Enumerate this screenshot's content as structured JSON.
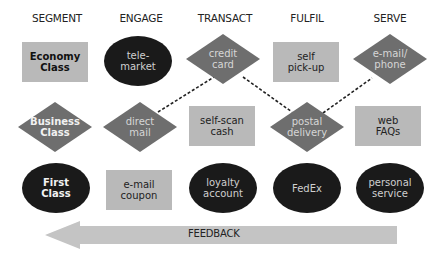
{
  "headers": [
    "SEGMENT",
    "ENGAGE",
    "TRANSACT",
    "FULFIL",
    "SERVE"
  ],
  "nodes": {
    "economy_class": {
      "label": "Economy\nClass",
      "shape": "rectangle"
    },
    "business_class": {
      "label": "Business\nClass",
      "shape": "diamond"
    },
    "first_class": {
      "label": "First\nClass",
      "shape": "ellipse"
    },
    "telemarket": {
      "label": "tele-\nmarket",
      "shape": "ellipse"
    },
    "direct_mail": {
      "label": "direct\nmail",
      "shape": "diamond"
    },
    "email_coupon": {
      "label": "e-mail\ncoupon",
      "shape": "rectangle"
    },
    "credit_card": {
      "label": "credit\ncard",
      "shape": "diamond"
    },
    "self_scan_cash": {
      "label": "self-scan\ncash",
      "shape": "rectangle"
    },
    "loyalty_account": {
      "label": "loyalty\naccount",
      "shape": "ellipse"
    },
    "self_pickup": {
      "label": "self\npick-up",
      "shape": "rectangle"
    },
    "postal_delivery": {
      "label": "postal\ndelivery",
      "shape": "diamond"
    },
    "fedex": {
      "label": "FedEx",
      "shape": "ellipse"
    },
    "email_phone": {
      "label": "e-mail/\nphone",
      "shape": "diamond"
    },
    "web_faqs": {
      "label": "web\nFAQs",
      "shape": "rectangle"
    },
    "personal_service": {
      "label": "personal\nservice",
      "shape": "ellipse"
    }
  },
  "connections": [
    {
      "from": "direct_mail",
      "to": "credit_card",
      "style": "dashed"
    },
    {
      "from": "credit_card",
      "to": "postal_delivery",
      "style": "dashed"
    },
    {
      "from": "postal_delivery",
      "to": "email_phone",
      "style": "dashed"
    }
  ],
  "feedback": {
    "label": "FEEDBACK",
    "direction": "right-to-left"
  },
  "colors": {
    "rect_fill": "#b9b9b9",
    "diamond_fill": "#6e6e6e",
    "ellipse_fill": "#1a1a1a",
    "arrow_fill": "#c4c4c4",
    "line": "#222222"
  }
}
